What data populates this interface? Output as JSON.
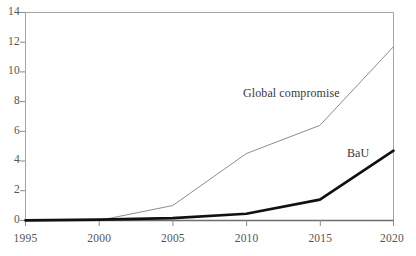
{
  "chart_data": {
    "type": "line",
    "title": "",
    "subtitle": "",
    "xlabel": "",
    "ylabel": "",
    "x": [
      1995,
      2000,
      2005,
      2010,
      2015,
      2020
    ],
    "categories": [
      "1995",
      "2000",
      "2005",
      "2010",
      "2015",
      "2020"
    ],
    "xlim": [
      1995,
      2020
    ],
    "ylim": [
      0,
      14
    ],
    "xticks": [
      "1995",
      "2000",
      "2005",
      "2010",
      "2015",
      "2020"
    ],
    "yticks": [
      "0",
      "2",
      "4",
      "6",
      "8",
      "10",
      "12",
      "14"
    ],
    "grid": false,
    "legend_position": "inline-annotation",
    "series": [
      {
        "name": "Global compromise",
        "values": [
          0,
          0,
          1.0,
          4.5,
          6.4,
          11.7
        ],
        "color": "#8c8c8c",
        "line_width": 1,
        "label_x": 1992,
        "label_y": 8
      },
      {
        "name": "BaU",
        "values": [
          0,
          0.05,
          0.15,
          0.45,
          1.4,
          4.7
        ],
        "color": "#111111",
        "line_width": 2.6,
        "label_x": 2017,
        "label_y": 5
      }
    ],
    "annotations": [
      {
        "text": "Global compromise",
        "series": "Global compromise"
      },
      {
        "text": "BaU",
        "series": "BaU"
      }
    ]
  },
  "axes": {
    "frame_color": "#9a9a9a",
    "tick_color": "#777777",
    "text_color": "#555555",
    "background": "#ffffff"
  },
  "yticks": [
    {
      "label": "14"
    },
    {
      "label": "12"
    },
    {
      "label": "10"
    },
    {
      "label": "8"
    },
    {
      "label": "6"
    },
    {
      "label": "4"
    },
    {
      "label": "2"
    },
    {
      "label": "0"
    }
  ],
  "xticks": [
    {
      "label": "1995"
    },
    {
      "label": "2000"
    },
    {
      "label": "2005"
    },
    {
      "label": "2010"
    },
    {
      "label": "2015"
    },
    {
      "label": "2020"
    }
  ],
  "labels": {
    "global_compromise": "Global compromise",
    "bau": "BaU"
  }
}
